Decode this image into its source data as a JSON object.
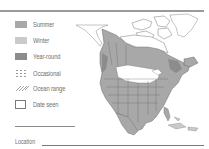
{
  "legend": {
    "items": [
      {
        "key": "summer",
        "label": "Summer",
        "color": "#a8a8a8"
      },
      {
        "key": "winter",
        "label": "Winter",
        "color": "#cacaca"
      },
      {
        "key": "year_round",
        "label": "Year-round",
        "color": "#8c8c8c"
      },
      {
        "key": "occasional",
        "label": "Occasional",
        "color": "#9a9a9a"
      },
      {
        "key": "ocean_range",
        "label": "Ocean range",
        "color": "#9a9a9a"
      },
      {
        "key": "date_seen",
        "label": "Date seen",
        "color": "#ffffff"
      }
    ]
  },
  "form": {
    "location_label": "Location"
  },
  "map": {
    "region": "North America range map",
    "summer_color": "#a8a8a8",
    "winter_color": "#cacaca",
    "year_round_color": "#8c8c8c",
    "border_color": "#555555"
  },
  "style": {
    "rule_color": "#9a9a9a"
  }
}
